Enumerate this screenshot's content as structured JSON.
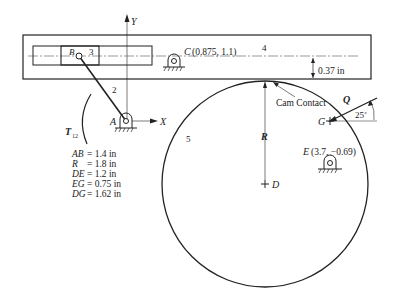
{
  "diagram": {
    "axes": {
      "y_label": "Y",
      "x_label": "X"
    },
    "links": {
      "link2": "2",
      "link3": "3",
      "link4": "4",
      "link5": "5"
    },
    "points": {
      "A": "A",
      "B": "B",
      "C": "C",
      "C_coords": "(0.875, 1.1)",
      "D": "D",
      "E": "E",
      "E_coords": "(3.7, −0.69)",
      "G": "G"
    },
    "torque": {
      "symbol": "T",
      "subscript": "12"
    },
    "force": {
      "symbol": "Q",
      "angle": "25˚"
    },
    "offset_dim": "0.37 in",
    "radius_label": "R",
    "cam_contact_label": "Cam Contact",
    "dimensions": [
      {
        "name": "AB",
        "eq": "= 1.4 in"
      },
      {
        "name": "R",
        "eq": "= 1.8 in"
      },
      {
        "name": "DE",
        "eq": "= 1.2 in"
      },
      {
        "name": "EG",
        "eq": "= 0.75 in"
      },
      {
        "name": "DG",
        "eq": "= 1.62 in"
      }
    ],
    "colors": {
      "ink": "#222222",
      "background": "#ffffff"
    }
  }
}
